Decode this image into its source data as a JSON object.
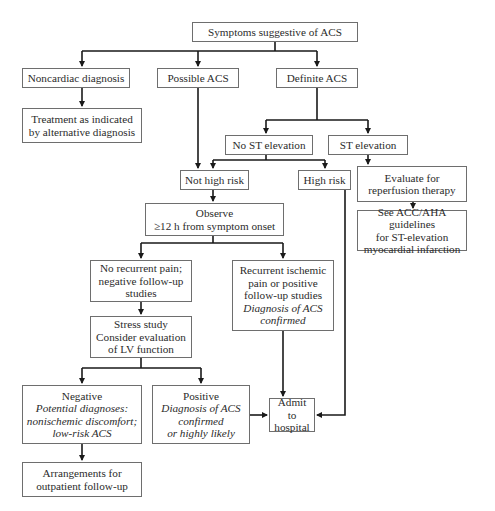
{
  "nodes": {
    "symptoms": {
      "lines": [
        "Symptoms suggestive of ACS"
      ]
    },
    "noncardiac": {
      "lines": [
        "Noncardiac diagnosis"
      ]
    },
    "possible_acs": {
      "lines": [
        "Possible ACS"
      ]
    },
    "definite_acs": {
      "lines": [
        "Definite ACS"
      ]
    },
    "treatment": {
      "lines": [
        "Treatment as indicated",
        "by alternative diagnosis"
      ]
    },
    "no_st": {
      "lines": [
        "No ST elevation"
      ]
    },
    "st": {
      "lines": [
        "ST elevation"
      ]
    },
    "not_high_risk": {
      "lines": [
        "Not high risk"
      ]
    },
    "high_risk": {
      "lines": [
        "High risk"
      ]
    },
    "evaluate": {
      "lines": [
        "Evaluate for",
        "reperfusion therapy"
      ]
    },
    "observe": {
      "lines": [
        "Observe",
        "≥12 h from symptom onset"
      ]
    },
    "see_acc": {
      "lines": [
        "See ACC/AHA guidelines",
        "for ST-elevation",
        "myocardial infarction"
      ]
    },
    "no_recurrent": {
      "lines": [
        "No recurrent pain;",
        "negative follow-up",
        "studies"
      ]
    },
    "recurrent": {
      "lines": [
        "Recurrent ischemic",
        "pain or positive",
        "follow-up studies"
      ],
      "italic": [
        "Diagnosis of ACS",
        "confirmed"
      ]
    },
    "stress": {
      "lines": [
        "Stress study",
        "Consider evaluation",
        "of LV function"
      ]
    },
    "negative": {
      "lines": [
        "Negative"
      ],
      "italic": [
        "Potential diagnoses:",
        "nonischemic discomfort;",
        "low-risk ACS"
      ]
    },
    "positive": {
      "lines": [
        "Positive"
      ],
      "italic": [
        "Diagnosis of ACS",
        "confirmed",
        "or highly likely"
      ]
    },
    "admit": {
      "lines": [
        "Admit to",
        "hospital"
      ]
    },
    "arrangements": {
      "lines": [
        "Arrangements for",
        "outpatient follow-up"
      ]
    }
  },
  "colors": {
    "line": "#1a1a1a",
    "border": "#6e6e6e",
    "text": "#2b2b2b"
  }
}
